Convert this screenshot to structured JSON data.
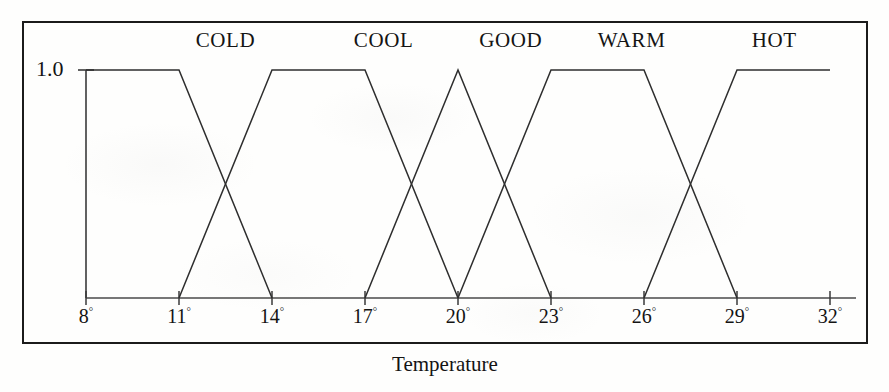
{
  "figure": {
    "y_axis_label": "1.0",
    "x_axis_title": "Temperature"
  },
  "chart_data": {
    "type": "line",
    "title": "",
    "subtitle": "",
    "xlabel": "Temperature",
    "ylabel": "1.0",
    "xlim": [
      8,
      32
    ],
    "ylim": [
      0,
      1.0
    ],
    "grid": false,
    "legend_position": "above-curves",
    "xticks": [
      8,
      11,
      14,
      17,
      20,
      23,
      26,
      29,
      32
    ],
    "xtick_labels": [
      "8°",
      "11°",
      "14°",
      "17°",
      "20°",
      "23°",
      "26°",
      "29°",
      "32°"
    ],
    "yticks": [
      1.0
    ],
    "ytick_labels": [
      "1.0"
    ],
    "annotations": [
      {
        "text": "COLD",
        "x": 12.5
      },
      {
        "text": "COOL",
        "x": 17.6
      },
      {
        "text": "GOOD",
        "x": 21.7
      },
      {
        "text": "WARM",
        "x": 25.6
      },
      {
        "text": "HOT",
        "x": 30.2
      }
    ],
    "series": [
      {
        "name": "COLD",
        "shape": "trapezoid",
        "x": [
          8,
          11,
          14
        ],
        "values": [
          1.0,
          1.0,
          0.0
        ]
      },
      {
        "name": "COOL",
        "shape": "trapezoid",
        "x": [
          11,
          14,
          17,
          20
        ],
        "values": [
          0.0,
          1.0,
          1.0,
          0.0
        ]
      },
      {
        "name": "GOOD",
        "shape": "triangle",
        "x": [
          17,
          20,
          23
        ],
        "values": [
          0.0,
          1.0,
          0.0
        ]
      },
      {
        "name": "WARM",
        "shape": "trapezoid",
        "x": [
          20,
          23,
          26,
          29
        ],
        "values": [
          0.0,
          1.0,
          1.0,
          0.0
        ]
      },
      {
        "name": "HOT",
        "shape": "trapezoid",
        "x": [
          26,
          29,
          32
        ],
        "values": [
          0.0,
          1.0,
          1.0
        ]
      }
    ]
  }
}
